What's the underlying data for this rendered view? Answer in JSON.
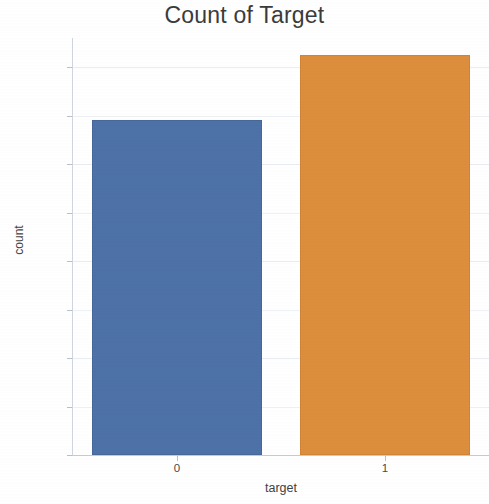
{
  "chart_data": {
    "type": "bar",
    "title": "Count of Target",
    "xlabel": "target",
    "ylabel": "count",
    "categories": [
      "0",
      "1"
    ],
    "values": [
      138,
      165
    ],
    "ylim": [
      0,
      172
    ],
    "yticks": [
      0,
      20,
      40,
      60,
      80,
      100,
      120,
      140,
      160
    ],
    "ytick_labels": [
      "0",
      "20",
      "40",
      "60",
      "80",
      "100",
      "120",
      "140",
      "160"
    ],
    "xtick_labels": [
      "0",
      "1"
    ],
    "grid": true,
    "legend": null,
    "colors": {
      "bar_0": "#4d72a8",
      "bar_1": "#dd8e3d",
      "background": "#ffffff",
      "grid": "#e9edf2",
      "text": "#3d3d3d"
    }
  }
}
